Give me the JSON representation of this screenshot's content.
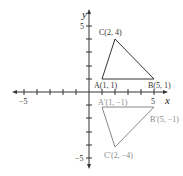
{
  "axes": {
    "x_label": "x",
    "y_label": "y",
    "x_ticks_labeled": [
      {
        "value": -5,
        "label": "−5"
      },
      {
        "value": 5,
        "label": "5"
      }
    ],
    "y_ticks_labeled": [
      {
        "value": 5,
        "label": "5"
      },
      {
        "value": -5,
        "label": "−5"
      }
    ],
    "range": [
      -5,
      5
    ]
  },
  "original_triangle": {
    "color": "#333333",
    "vertices": [
      {
        "name": "A",
        "x": 1,
        "y": 1,
        "label": "A(1, 1)"
      },
      {
        "name": "B",
        "x": 5,
        "y": 1,
        "label": "B(5, 1)"
      },
      {
        "name": "C",
        "x": 2,
        "y": 4,
        "label": "C(2, 4)"
      }
    ]
  },
  "reflected_triangle": {
    "color": "#888888",
    "vertices": [
      {
        "name": "A'",
        "x": 1,
        "y": -1,
        "label": "A′(1, −1)"
      },
      {
        "name": "B'",
        "x": 5,
        "y": -1,
        "label": "B′(5, −1)"
      },
      {
        "name": "C'",
        "x": 2,
        "y": -4,
        "label": "C′(2, −4)"
      }
    ]
  }
}
